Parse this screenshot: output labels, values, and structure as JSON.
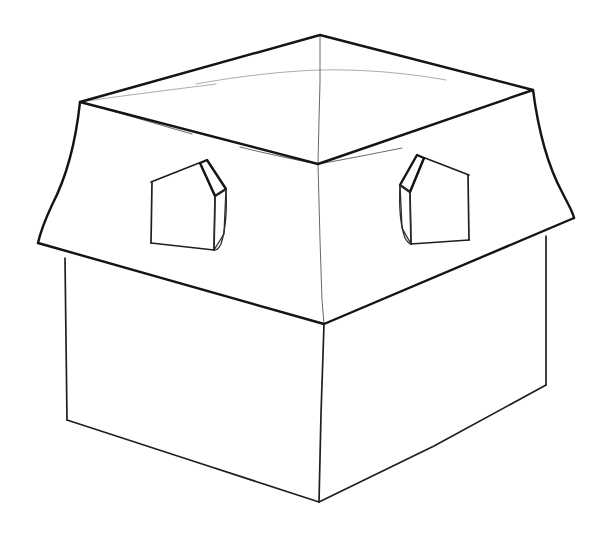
{
  "artwork": {
    "title": "Hip roof house line drawing",
    "subject": "house-with-dormers",
    "style": "black-and-white line art",
    "medium": "pen outline drawing",
    "background_color": "#ffffff",
    "ink_color": "#1a1a1a",
    "canvas": {
      "width": 600,
      "height": 543
    }
  },
  "parts": {
    "roof": {
      "label": "hipped roof",
      "peak": {
        "x": 320,
        "y": 35
      },
      "back_left_corner": {
        "x": 80,
        "y": 102
      },
      "back_right_corner": {
        "x": 533,
        "y": 90
      },
      "ridge_center": {
        "x": 318,
        "y": 164
      },
      "front_valley": {
        "x": 324,
        "y": 324
      },
      "eave_left": {
        "x": 38,
        "y": 243
      },
      "eave_right": {
        "x": 574,
        "y": 218
      },
      "outline_path": "M 320 35 L 80 102 L 318 164 L 533 90 Z",
      "front_left_slope_path": "M 80 102 L 318 164 L 324 324 L 38 243 Z",
      "front_right_slope_path": "M 318 164 L 533 90 L 574 218 L 324 324 Z",
      "left_flare_path": "M 80 102 C 76 140 66 178 52 205 C 45 220 40 234 38 243",
      "right_flare_path": "M 533 90 C 538 128 548 166 562 192 C 569 206 573 212 574 218",
      "left_eave_edge_path": "M 38 243 L 324 324",
      "right_eave_edge_path": "M 324 324 L 574 218",
      "center_crease_path": "M 320 35 L 320 82 L 319 120 L 318 164 L 320 240 L 322 300 L 324 324",
      "top_cross_curve_path": "M 196 84 C 240 76 285 71 320 70 C 362 69 408 73 446 80",
      "top_left_spur_path": "M 80 102 C 120 96 170 90 216 84",
      "roof_back_left_crease_path": "M 80 102 C 118 112 156 124 192 134",
      "ridge_left_fade_path": "M 318 164 C 296 160 268 154 240 147",
      "ridge_right_fade_path": "M 318 164 C 342 160 372 154 402 148"
    },
    "walls": {
      "label": "house body box",
      "front_top_corner": {
        "x": 324,
        "y": 324
      },
      "front_bottom_corner": {
        "x": 319,
        "y": 502
      },
      "left_top_corner": {
        "x": 65,
        "y": 258
      },
      "left_bottom_corner": {
        "x": 67,
        "y": 420
      },
      "right_top_corner": {
        "x": 546,
        "y": 236
      },
      "right_bottom_corner": {
        "x": 546,
        "y": 385
      },
      "front_vertical_path": "M 324 324 L 321 414 L 319 502",
      "left_vertical_path": "M 65 258 L 66 340 L 67 420",
      "right_vertical_path": "M 546 236 L 546 312 L 546 385",
      "bottom_left_path": "M 67 420 L 196 462 L 319 502",
      "bottom_right_path": "M 319 502 L 434 446 L 546 385"
    },
    "dormers": [
      {
        "id": "dormer-left",
        "label": "left dormer window",
        "side": "left roof slope",
        "face_path": "M 152 182 L 151 243 L 214 250 L 215 196 L 200 163 Z",
        "roof_slope_path": "M 200 163 L 215 196 L 226 189 L 207 160 Z",
        "side_wall_path": "M 215 196 L 226 189 L 224 234 L 214 250 Z",
        "eave_line_path": "M 151 182 L 199 163",
        "ridge_line_path": "M 200 163 L 215 196",
        "left_edge_path": "M 152 182 L 151 243",
        "bottom_edge_path": "M 151 243 L 214 250",
        "right_edge_path": "M 214 250 L 215 196",
        "curve_tail_path": "M 226 189 C 227 208 226 228 221 244 C 218 250 216 250 214 250"
      },
      {
        "id": "dormer-right",
        "label": "right dormer window",
        "side": "right roof slope",
        "face_path": "M 468 175 L 469 240 L 411 244 L 410 192 L 424 158 Z",
        "roof_slope_path": "M 424 158 L 410 192 L 400 185 L 417 155 Z",
        "side_wall_path": "M 410 192 L 400 185 L 402 228 L 411 244 Z",
        "eave_line_path": "M 469 175 L 425 158",
        "ridge_line_path": "M 424 158 L 410 192",
        "right_edge_path": "M 468 175 L 469 240",
        "bottom_edge_path": "M 469 240 L 411 244",
        "left_edge_path": "M 411 244 L 410 192",
        "curve_tail_path": "M 400 185 C 399 204 400 224 405 238 C 408 243 410 244 411 244"
      }
    ]
  },
  "annotations": {
    "line_weights": {
      "strong": "roof outline and hip ridges",
      "medium": "wall edges and dormer outlines",
      "faint": "construction creases on roof surface"
    },
    "stroke_counts": {
      "strong": 8,
      "medium": 14,
      "faint": 6
    }
  }
}
